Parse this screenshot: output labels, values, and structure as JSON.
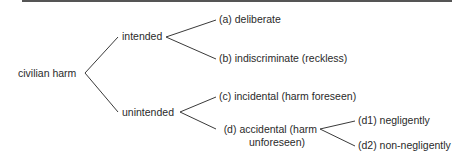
{
  "diagram": {
    "root": "civilian harm",
    "intended": {
      "label": "intended",
      "children": [
        "(a) deliberate",
        "(b) indiscriminate (reckless)"
      ]
    },
    "unintended": {
      "label": "unintended",
      "children": [
        "(c) incidental (harm foreseen)"
      ],
      "accidental": {
        "line1": "(d) accidental (harm",
        "line2": "unforeseen)",
        "children": [
          "(d1) negligently",
          "(d2) non-negligently"
        ]
      }
    },
    "colors": {
      "line": "#3a3a3a",
      "text": "#2a2a2a",
      "rule": "#555555"
    }
  }
}
